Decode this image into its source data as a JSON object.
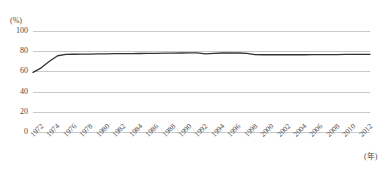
{
  "chart_data": {
    "type": "line",
    "title": "",
    "subtitle": "",
    "xlabel": "(年)",
    "ylabel": "(%)",
    "ylim": [
      0,
      100
    ],
    "xlim": [
      1972,
      2013
    ],
    "grid": true,
    "legend": "none",
    "yticks": [
      "0",
      "20",
      "40",
      "60",
      "80",
      "100"
    ],
    "ytick_values": [
      0,
      20,
      40,
      60,
      80,
      100
    ],
    "categories": [
      "1972",
      "1973",
      "1974",
      "1975",
      "1976",
      "1977",
      "1978",
      "1979",
      "1980",
      "1981",
      "1982",
      "1983",
      "1984",
      "1985",
      "1986",
      "1987",
      "1988",
      "1989",
      "1990",
      "1991",
      "1992",
      "1993",
      "1994",
      "1995",
      "1996",
      "1997",
      "1998",
      "1999",
      "2000",
      "2001",
      "2002",
      "2003",
      "2004",
      "2005",
      "2006",
      "2007",
      "2008",
      "2009",
      "2010",
      "2011",
      "2012",
      "2013"
    ],
    "xtick_labels": [
      "1972",
      "1974",
      "1976",
      "1978",
      "1980",
      "1982",
      "1984",
      "1986",
      "1988",
      "1990",
      "1992",
      "1994",
      "1996",
      "1998",
      "2000",
      "2002",
      "2004",
      "2006",
      "2008",
      "2010",
      "2012"
    ],
    "values": [
      59.0,
      63.5,
      70.0,
      75.5,
      76.8,
      77.0,
      77.1,
      77.2,
      77.3,
      77.4,
      77.5,
      77.6,
      77.6,
      77.7,
      77.8,
      77.9,
      78.0,
      78.1,
      78.2,
      78.3,
      78.3,
      77.3,
      77.9,
      78.2,
      78.3,
      78.2,
      77.9,
      76.6,
      76.5,
      76.5,
      76.5,
      76.5,
      76.5,
      76.5,
      76.6,
      76.6,
      76.7,
      76.7,
      76.8,
      76.8,
      76.9,
      76.9
    ],
    "series": [
      {
        "name": "rate",
        "color": "#333333",
        "values": [
          59.0,
          63.5,
          70.0,
          75.5,
          76.8,
          77.0,
          77.1,
          77.2,
          77.3,
          77.4,
          77.5,
          77.6,
          77.6,
          77.7,
          77.8,
          77.9,
          78.0,
          78.1,
          78.2,
          78.3,
          78.3,
          77.3,
          77.9,
          78.2,
          78.3,
          78.2,
          77.9,
          76.6,
          76.5,
          76.5,
          76.5,
          76.5,
          76.5,
          76.5,
          76.6,
          76.6,
          76.7,
          76.7,
          76.8,
          76.8,
          76.9,
          76.9
        ]
      }
    ],
    "colors": {
      "line": "#333333",
      "grid": "#c9c9c9",
      "text": "#4a4a4a",
      "background": "#ffffff"
    }
  }
}
